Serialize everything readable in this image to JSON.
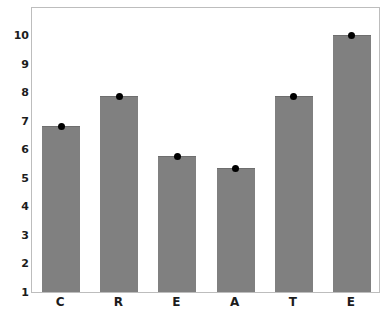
{
  "chart_data": {
    "type": "bar",
    "title": "",
    "xlabel": "",
    "ylabel": "",
    "categories": [
      "C",
      "R",
      "E",
      "A",
      "T",
      "E"
    ],
    "values": [
      6.8,
      7.85,
      5.75,
      5.35,
      7.85,
      10.0
    ],
    "series": [
      {
        "name": "value",
        "values": [
          6.8,
          7.85,
          5.75,
          5.35,
          7.85,
          10.0
        ]
      }
    ],
    "point_markers": [
      6.8,
      7.85,
      5.75,
      5.35,
      7.85,
      10.0
    ],
    "ylim": [
      1,
      10
    ],
    "ytick_labels": [
      "10",
      "9",
      "8",
      "7",
      "6",
      "5",
      "4",
      "3",
      "2",
      "1"
    ],
    "ytick_values": [
      10,
      9,
      8,
      7,
      6,
      5,
      4,
      3,
      2,
      1
    ],
    "xtick_labels": [
      "C",
      "R",
      "E",
      "A",
      "T",
      "E"
    ],
    "grid": false,
    "legend": false,
    "legend_position": "none",
    "bar_color": "#808080",
    "marker_color": "#000000",
    "frame_color": "#bdbdbd",
    "background_color": "#ffffff",
    "text_color": "#1c1c1c"
  }
}
